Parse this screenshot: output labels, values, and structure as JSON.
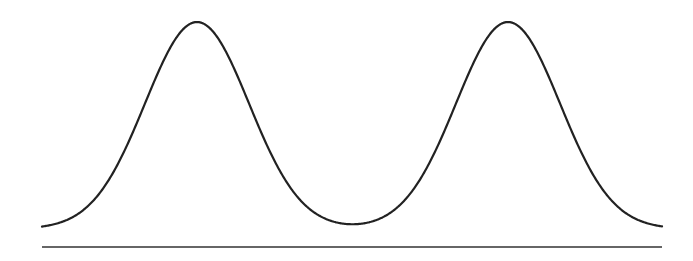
{
  "chart_data": {
    "type": "line",
    "title": "",
    "xlabel": "",
    "ylabel": "",
    "series": [
      {
        "name": "bimodal-curve",
        "peaks": [
          {
            "center_px": 197,
            "sigma_px": 52
          },
          {
            "center_px": 508,
            "sigma_px": 52
          }
        ],
        "x_range_px": [
          42,
          662
        ],
        "peak_y_px": 22,
        "base_y_px": 229
      }
    ],
    "baseline": {
      "x1": 42,
      "x2": 662,
      "y": 247
    },
    "grid": false,
    "legend": null
  },
  "style": {
    "curve_color": "#222222",
    "baseline_color": "#333333",
    "background": "#ffffff"
  }
}
